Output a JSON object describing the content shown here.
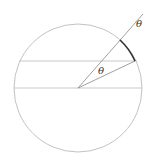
{
  "diagram": {
    "type": "geometry",
    "colors": {
      "circle": "#bbbbbb",
      "lines": "#bbbbbb",
      "rays": "#888888",
      "arc_highlight": "#333333",
      "labels": "#333333"
    },
    "circle": {
      "cx": 78,
      "cy": 88,
      "r": 64
    },
    "horizontal_lines": [
      {
        "name": "upper-chord",
        "y": 61
      },
      {
        "name": "diameter",
        "y": 88
      }
    ],
    "rays": [
      {
        "name": "outer-ray",
        "from": [
          78,
          88
        ],
        "to": [
          143,
          14
        ]
      },
      {
        "name": "radius-ray",
        "from": [
          78,
          88
        ],
        "to": [
          135,
          61
        ]
      }
    ],
    "arc": {
      "from": [
        120,
        40
      ],
      "to": [
        135,
        61
      ]
    },
    "labels": {
      "theta_inner": "θ",
      "theta_outer": "θ"
    }
  }
}
